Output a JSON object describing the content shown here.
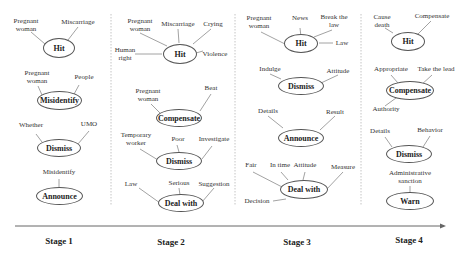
{
  "timeline": {
    "stages": [
      "Stage 1",
      "Stage 2",
      "Stage 3",
      "Stage 4"
    ],
    "arrow_direction": "right"
  },
  "stage1": {
    "hit": {
      "node": "Hit",
      "terms": [
        "Pregnant\nwoman",
        "Miscarriage"
      ]
    },
    "misidentify": {
      "node": "Misidentify",
      "terms": [
        "Pregnant\nwoman",
        "People"
      ]
    },
    "dismiss": {
      "node": "Dismiss",
      "terms": [
        "Whether",
        "UMO"
      ]
    },
    "announce": {
      "node": "Announce",
      "terms": [
        "Misidentify"
      ]
    }
  },
  "stage2": {
    "hit": {
      "node": "Hit",
      "terms": [
        "Pregnant\nwoman",
        "Miscarriage",
        "Crying",
        "Human\nright",
        "Violence"
      ]
    },
    "compensate": {
      "node": "Compensate",
      "terms": [
        "Pregnant\nwoman",
        "Beat"
      ]
    },
    "dismiss": {
      "node": "Dismiss",
      "terms": [
        "Temporary\nworker",
        "Poor",
        "Investigate"
      ]
    },
    "deal_with": {
      "node": "Deal with",
      "terms": [
        "Law",
        "Serious",
        "Suggestion"
      ]
    }
  },
  "stage3": {
    "hit": {
      "node": "Hit",
      "terms": [
        "Pregnant\nwoman",
        "News",
        "Break the\nlaw",
        "Law"
      ]
    },
    "dismiss": {
      "node": "Dismiss",
      "terms": [
        "Indulge",
        "Attitude"
      ]
    },
    "announce": {
      "node": "Announce",
      "terms": [
        "Details",
        "Result"
      ]
    },
    "deal_with": {
      "node": "Deal with",
      "terms": [
        "Fair",
        "In time",
        "Attitude",
        "Measure",
        "Decision"
      ]
    }
  },
  "stage4": {
    "hit": {
      "node": "Hit",
      "terms": [
        "Cause\ndeath",
        "Compensate"
      ]
    },
    "compensate": {
      "node": "Compensate",
      "terms": [
        "Appropriate",
        "Take the lead",
        "Authority"
      ]
    },
    "dismiss": {
      "node": "Dismiss",
      "terms": [
        "Details",
        "Behavior"
      ]
    },
    "warn": {
      "node": "Warn",
      "terms": [
        "Administrative\nsanction"
      ]
    }
  },
  "colors": {
    "line": "#8a8a8a",
    "node_border": "#555555",
    "divider": "#bdbdbd",
    "arrow": "#666666"
  }
}
